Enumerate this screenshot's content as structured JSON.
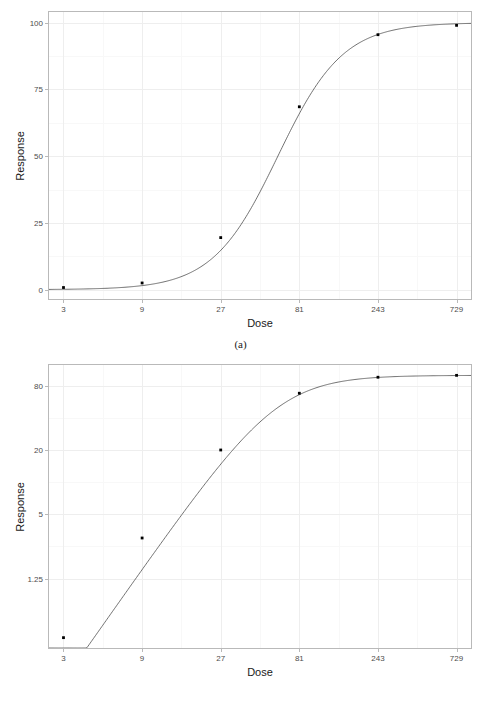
{
  "figure": {
    "panels": [
      {
        "id": "a",
        "caption": "(a)",
        "xlabel": "Dose",
        "ylabel": "Response"
      },
      {
        "id": "b",
        "caption": "(b)",
        "xlabel": "Dose",
        "ylabel": "Response"
      }
    ]
  },
  "chart_data": [
    {
      "type": "line",
      "title": "",
      "subtitle": "",
      "caption": "(a)",
      "xlabel": "Dose",
      "ylabel": "Response",
      "xscale": "log",
      "xbase": 3,
      "yscale": "linear",
      "xticks": [
        3,
        9,
        27,
        81,
        243,
        729
      ],
      "xticklabels": [
        "3",
        "9",
        "27",
        "81",
        "243",
        "729"
      ],
      "yticks": [
        0,
        25,
        50,
        75,
        100
      ],
      "yticklabels": [
        "0",
        "25",
        "50",
        "75",
        "100"
      ],
      "xlim": [
        2.45,
        892
      ],
      "ylim": [
        -3.5,
        104
      ],
      "grid": true,
      "legend": "none",
      "marker": "point",
      "markersize": 2,
      "linecolor": "#4d4d4d",
      "markercolor": "#000000",
      "x": [
        3,
        9,
        27,
        81,
        243,
        729
      ],
      "values": [
        0.8,
        2.5,
        19.5,
        68.5,
        95.5,
        99.0
      ],
      "series": [
        {
          "name": "Response",
          "x": [
            3,
            9,
            27,
            81,
            243,
            729
          ],
          "values": [
            0.8,
            2.5,
            19.5,
            68.5,
            95.5,
            99.0
          ]
        }
      ],
      "curve_model": "four-parameter logistic (Emax) on log dose",
      "curve_params": {
        "bottom": 0.0,
        "top": 100.0,
        "ed50": 60.0,
        "hill": 2.2
      }
    },
    {
      "type": "line",
      "title": "",
      "subtitle": "",
      "caption": "(b)",
      "xlabel": "Dose",
      "ylabel": "Response",
      "xscale": "log",
      "xbase": 3,
      "yscale": "log",
      "ybase": 4,
      "xticks": [
        3,
        9,
        27,
        81,
        243,
        729
      ],
      "xticklabels": [
        "3",
        "9",
        "27",
        "81",
        "243",
        "729"
      ],
      "yticks": [
        1.25,
        5,
        20,
        80
      ],
      "yticklabels": [
        "1.25",
        "5",
        "20",
        "80"
      ],
      "xlim": [
        2.45,
        892
      ],
      "ylim": [
        0.28,
        125
      ],
      "grid": true,
      "legend": "none",
      "marker": "point",
      "markersize": 2,
      "linecolor": "#4d4d4d",
      "markercolor": "#000000",
      "x": [
        3,
        9,
        27,
        81,
        243,
        729
      ],
      "values": [
        0.35,
        3.0,
        20.0,
        68.0,
        96.0,
        100.0
      ],
      "series": [
        {
          "name": "Response",
          "x": [
            3,
            9,
            27,
            81,
            243,
            729
          ],
          "values": [
            0.35,
            3.0,
            20.0,
            68.0,
            96.0,
            100.0
          ]
        }
      ],
      "curve_model": "same Emax curve plotted on log response axis",
      "curve_params": {
        "bottom": 0.0,
        "top": 100.0,
        "ed50": 60.0,
        "hill": 2.2
      }
    }
  ]
}
